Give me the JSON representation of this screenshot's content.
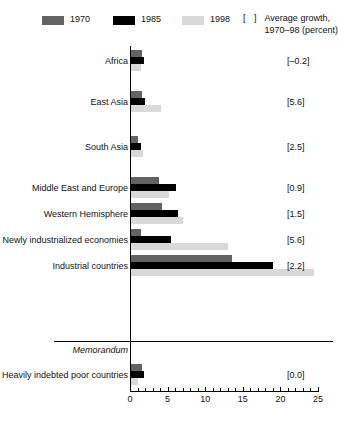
{
  "legend": {
    "series": [
      {
        "label": "1970",
        "color": "#636363"
      },
      {
        "label": "1985",
        "color": "#000000"
      },
      {
        "label": "1998",
        "color": "#d9d9d9"
      }
    ],
    "note_bracket": "[    ]",
    "note_line1": "Average growth,",
    "note_line2": "1970–98 (percent)"
  },
  "memorandum_title": "Memorandum",
  "axis": {
    "ticks_major": [
      0,
      5,
      10,
      15,
      20,
      25
    ],
    "ticks_minor": [
      1,
      2,
      3,
      4,
      6,
      7,
      8,
      9,
      11,
      12,
      13,
      14,
      16,
      17,
      18,
      19,
      21,
      22,
      23,
      24
    ],
    "labels": [
      "0",
      "5",
      "10",
      "15",
      "20",
      "25"
    ]
  },
  "chart_data": {
    "type": "bar",
    "orientation": "horizontal",
    "title": "",
    "xlabel": "",
    "ylabel": "",
    "xlim": [
      0,
      25
    ],
    "grid": false,
    "legend_position": "top",
    "categories": [
      "Africa",
      "East Asia",
      "South Asia",
      "Middle East and Europe",
      "Western Hemisphere",
      "Newly industrialized economies",
      "Industrial countries"
    ],
    "memorandum_categories": [
      "Heavily indebted poor countries"
    ],
    "series": [
      {
        "name": "1970",
        "color": "#636363",
        "values": [
          1.6,
          1.6,
          1.1,
          3.9,
          4.2,
          1.5,
          13.5
        ],
        "memorandum_values": [
          1.6
        ]
      },
      {
        "name": "1985",
        "color": "#000000",
        "values": [
          1.9,
          2.0,
          1.4,
          6.1,
          6.4,
          5.5,
          19.0
        ],
        "memorandum_values": [
          1.9
        ]
      },
      {
        "name": "1998",
        "color": "#d9d9d9",
        "values": [
          1.4,
          4.1,
          1.7,
          5.2,
          7.1,
          13.0,
          24.5
        ],
        "memorandum_values": [
          1.1
        ]
      }
    ],
    "annotations": {
      "label": "Average growth, 1970–98 (percent)",
      "values": [
        {
          "category": "Africa",
          "text": "[–0.2]"
        },
        {
          "category": "East Asia",
          "text": "[5.6]"
        },
        {
          "category": "South Asia",
          "text": "[2.5]"
        },
        {
          "category": "Middle East and Europe",
          "text": "[0.9]"
        },
        {
          "category": "Western Hemisphere",
          "text": "[1.5]"
        },
        {
          "category": "Newly industrialized economies",
          "text": "[5.6]"
        },
        {
          "category": "Industrial countries",
          "text": "[2.2]"
        },
        {
          "category": "Heavily indebted poor countries",
          "text": "[0.0]"
        }
      ]
    }
  }
}
